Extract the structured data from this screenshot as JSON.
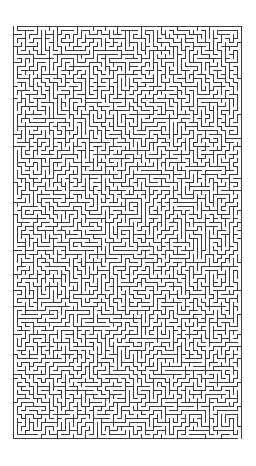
{
  "page": {
    "title": "Maze",
    "width": 256,
    "height": 466,
    "background_color": "#ffffff"
  },
  "maze": {
    "name": "maze-puzzle",
    "description": "Dense rectangular perfect maze with thin dark walls on a white background",
    "columns": 57,
    "rows": 103,
    "cell_pitch_px": 4,
    "wall_thickness_px": 1,
    "wall_color": "#3a3a3a",
    "passage_color": "#ffffff",
    "offset_x_px": 13,
    "offset_y_px": 26,
    "area_width_px": 230,
    "area_height_px": 415,
    "border": "closed rectangular outer wall",
    "entrance": {
      "side": "top",
      "column": 0
    },
    "exit": {
      "side": "bottom",
      "column": 56
    },
    "generator": {
      "algorithm": "randomized-depth-first-search",
      "seed": 20240917
    }
  }
}
